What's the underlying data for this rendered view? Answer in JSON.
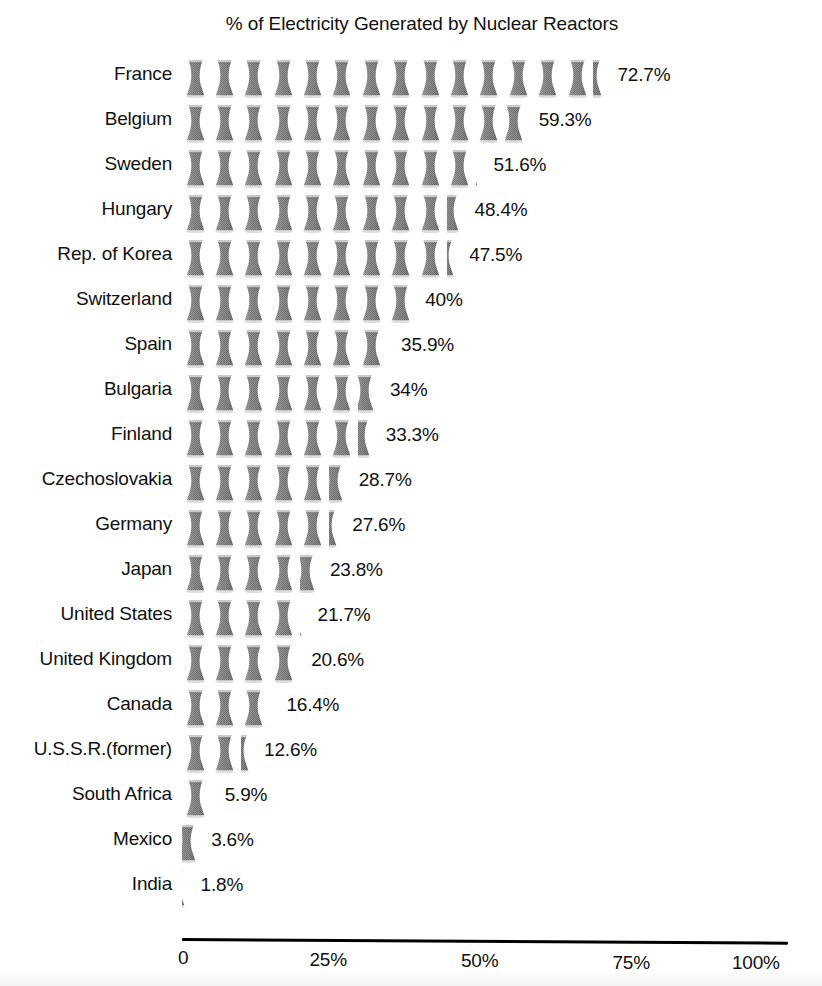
{
  "chart_data": {
    "type": "bar",
    "title": "% of Electricity Generated by Nuclear Reactors",
    "xlabel": "",
    "ylabel": "",
    "xlim": [
      0,
      100
    ],
    "grid": false,
    "legend": null,
    "unit": "%",
    "pictogram": {
      "icon": "cooling-tower-icon",
      "value_per_icon": 5,
      "icon_fill": "#8a8a8a"
    },
    "xticks": [
      {
        "label": "0",
        "value": 0
      },
      {
        "label": "25%",
        "value": 25
      },
      {
        "label": "50%",
        "value": 50
      },
      {
        "label": "75%",
        "value": 75
      },
      {
        "label": "100%",
        "value": 100
      }
    ],
    "categories": [
      "France",
      "Belgium",
      "Sweden",
      "Hungary",
      "Rep. of Korea",
      "Switzerland",
      "Spain",
      "Bulgaria",
      "Finland",
      "Czechoslovakia",
      "Germany",
      "Japan",
      "United States",
      "United Kingdom",
      "Canada",
      "U.S.S.R.(former)",
      "South Africa",
      "Mexico",
      "India"
    ],
    "values": [
      72.7,
      59.3,
      51.6,
      48.4,
      47.5,
      40,
      35.9,
      34,
      33.3,
      28.7,
      27.6,
      23.8,
      21.7,
      20.6,
      16.4,
      12.6,
      5.9,
      3.6,
      1.8
    ],
    "value_labels": [
      "72.7%",
      "59.3%",
      "51.6%",
      "48.4%",
      "47.5%",
      "40%",
      "35.9%",
      "34%",
      "33.3%",
      "28.7%",
      "27.6%",
      "23.8%",
      "21.7%",
      "20.6%",
      "16.4%",
      "12.6%",
      "5.9%",
      "3.6%",
      "1.8%"
    ],
    "rows": [
      {
        "label": "France",
        "value": 72.7,
        "value_label": "72.7%"
      },
      {
        "label": "Belgium",
        "value": 59.3,
        "value_label": "59.3%"
      },
      {
        "label": "Sweden",
        "value": 51.6,
        "value_label": "51.6%"
      },
      {
        "label": "Hungary",
        "value": 48.4,
        "value_label": "48.4%"
      },
      {
        "label": "Rep. of Korea",
        "value": 47.5,
        "value_label": "47.5%"
      },
      {
        "label": "Switzerland",
        "value": 40,
        "value_label": "40%"
      },
      {
        "label": "Spain",
        "value": 35.9,
        "value_label": "35.9%"
      },
      {
        "label": "Bulgaria",
        "value": 34,
        "value_label": "34%"
      },
      {
        "label": "Finland",
        "value": 33.3,
        "value_label": "33.3%"
      },
      {
        "label": "Czechoslovakia",
        "value": 28.7,
        "value_label": "28.7%"
      },
      {
        "label": "Germany",
        "value": 27.6,
        "value_label": "27.6%"
      },
      {
        "label": "Japan",
        "value": 23.8,
        "value_label": "23.8%"
      },
      {
        "label": "United States",
        "value": 21.7,
        "value_label": "21.7%"
      },
      {
        "label": "United Kingdom",
        "value": 20.6,
        "value_label": "20.6%"
      },
      {
        "label": "Canada",
        "value": 16.4,
        "value_label": "16.4%"
      },
      {
        "label": "U.S.S.R.(former)",
        "value": 12.6,
        "value_label": "12.6%"
      },
      {
        "label": "South Africa",
        "value": 5.9,
        "value_label": "5.9%"
      },
      {
        "label": "Mexico",
        "value": 3.6,
        "value_label": "3.6%"
      },
      {
        "label": "India",
        "value": 1.8,
        "value_label": "1.8%"
      }
    ]
  }
}
